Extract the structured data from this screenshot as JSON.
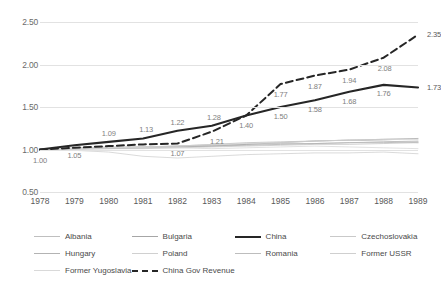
{
  "chart_data": {
    "type": "line",
    "title": "",
    "subtitle": "",
    "xlabel": "",
    "ylabel": "",
    "x": [
      1978,
      1979,
      1980,
      1981,
      1982,
      1983,
      1984,
      1985,
      1986,
      1987,
      1988,
      1989
    ],
    "categories": [
      "1978",
      "1979",
      "1980",
      "1981",
      "1982",
      "1983",
      "1984",
      "1985",
      "1986",
      "1987",
      "1988",
      "1989"
    ],
    "ylim": [
      0.5,
      2.5
    ],
    "yticks": [
      0.5,
      1.0,
      1.5,
      2.0,
      2.5
    ],
    "ytick_labels": [
      "0.50",
      "1.00",
      "1.50",
      "2.00",
      "2.50"
    ],
    "grid": true,
    "legend_position": "bottom",
    "series": [
      {
        "name": "Albania",
        "style": "thin-grey",
        "color": "#bfbfbf",
        "width": 0.8,
        "dash": "none",
        "labelled": false,
        "values": [
          1.0,
          1.01,
          1.02,
          1.03,
          1.04,
          1.05,
          1.06,
          1.07,
          1.07,
          1.08,
          1.09,
          1.1
        ]
      },
      {
        "name": "Bulgaria",
        "style": "thin-grey",
        "color": "#a6a6a6",
        "width": 0.8,
        "dash": "none",
        "labelled": false,
        "values": [
          1.0,
          1.01,
          1.02,
          1.02,
          1.03,
          1.04,
          1.06,
          1.08,
          1.1,
          1.11,
          1.12,
          1.13
        ]
      },
      {
        "name": "China",
        "style": "thick-black",
        "color": "#262626",
        "width": 2.1,
        "dash": "none",
        "labelled": true,
        "values": [
          1.0,
          1.05,
          1.09,
          1.13,
          1.22,
          1.28,
          1.4,
          1.5,
          1.58,
          1.68,
          1.76,
          1.73
        ]
      },
      {
        "name": "Czechoslovakia",
        "style": "thin-grey",
        "color": "#c9c9c9",
        "width": 0.8,
        "dash": "none",
        "labelled": false,
        "values": [
          1.0,
          1.0,
          1.01,
          1.01,
          1.02,
          1.03,
          1.04,
          1.05,
          1.06,
          1.06,
          1.07,
          1.08
        ]
      },
      {
        "name": "Hungary",
        "style": "thin-grey",
        "color": "#b3b3b3",
        "width": 0.8,
        "dash": "none",
        "labelled": false,
        "values": [
          1.0,
          1.01,
          1.01,
          1.02,
          1.03,
          1.04,
          1.05,
          1.06,
          1.07,
          1.08,
          1.08,
          1.09
        ]
      },
      {
        "name": "Poland",
        "style": "thin-grey",
        "color": "#d0d0d0",
        "width": 0.8,
        "dash": "none",
        "labelled": false,
        "values": [
          1.0,
          0.99,
          0.97,
          0.92,
          0.9,
          0.92,
          0.94,
          0.95,
          0.96,
          0.96,
          0.97,
          0.95
        ]
      },
      {
        "name": "Romania",
        "style": "thin-grey",
        "color": "#bdbdbd",
        "width": 0.8,
        "dash": "none",
        "labelled": false,
        "values": [
          1.0,
          1.02,
          1.03,
          1.03,
          1.04,
          1.06,
          1.08,
          1.09,
          1.1,
          1.11,
          1.1,
          1.08
        ]
      },
      {
        "name": "Former USSR",
        "style": "thin-grey",
        "color": "#cfcfcf",
        "width": 0.8,
        "dash": "none",
        "labelled": false,
        "values": [
          1.0,
          1.01,
          1.02,
          1.03,
          1.04,
          1.06,
          1.07,
          1.08,
          1.1,
          1.11,
          1.12,
          1.12
        ]
      },
      {
        "name": "Former Yugoslavia",
        "style": "thin-grey",
        "color": "#d9d9d9",
        "width": 0.8,
        "dash": "none",
        "labelled": false,
        "values": [
          1.0,
          1.01,
          1.02,
          1.02,
          1.02,
          1.01,
          1.02,
          1.03,
          1.04,
          1.03,
          1.02,
          1.01
        ]
      },
      {
        "name": "China Gov Revenue",
        "style": "thick-dashed-black",
        "color": "#262626",
        "width": 2.0,
        "dash": "7 4",
        "labelled": true,
        "values": [
          1.0,
          1.02,
          1.04,
          1.06,
          1.07,
          1.21,
          1.4,
          1.77,
          1.87,
          1.94,
          2.08,
          2.35
        ]
      }
    ],
    "data_labels": [
      {
        "series": "China",
        "x": 1978,
        "value": "1.00",
        "dx": 0,
        "dy": 10
      },
      {
        "series": "China",
        "x": 1979,
        "value": "1.05",
        "dx": 0,
        "dy": 10
      },
      {
        "series": "China",
        "x": 1980,
        "value": "1.09",
        "dx": 0,
        "dy": -9
      },
      {
        "series": "China",
        "x": 1981,
        "value": "1.13",
        "dx": 3,
        "dy": -9
      },
      {
        "series": "China",
        "x": 1982,
        "value": "1.22",
        "dx": 0,
        "dy": -9
      },
      {
        "series": "China",
        "x": 1983,
        "value": "1.28",
        "dx": 2,
        "dy": -9
      },
      {
        "series": "China",
        "x": 1984,
        "value": "1.40",
        "dx": 0,
        "dy": 9
      },
      {
        "series": "China",
        "x": 1985,
        "value": "1.50",
        "dx": 0,
        "dy": 9
      },
      {
        "series": "China",
        "x": 1986,
        "value": "1.58",
        "dx": 0,
        "dy": 9
      },
      {
        "series": "China",
        "x": 1987,
        "value": "1.68",
        "dx": 0,
        "dy": 9
      },
      {
        "series": "China",
        "x": 1988,
        "value": "1.76",
        "dx": 0,
        "dy": 8
      },
      {
        "series": "China",
        "x": 1989,
        "value": "1.73",
        "dx": 16,
        "dy": 0
      },
      {
        "series": "China Gov Revenue",
        "x": 1982,
        "value": "1.07",
        "dx": 0,
        "dy": 9
      },
      {
        "series": "China Gov Revenue",
        "x": 1983,
        "value": "1.21",
        "dx": 5,
        "dy": 9
      },
      {
        "series": "China Gov Revenue",
        "x": 1985,
        "value": "1.77",
        "dx": 0,
        "dy": 10
      },
      {
        "series": "China Gov Revenue",
        "x": 1986,
        "value": "1.87",
        "dx": 0,
        "dy": 10
      },
      {
        "series": "China Gov Revenue",
        "x": 1987,
        "value": "1.94",
        "dx": 0,
        "dy": 10
      },
      {
        "series": "China Gov Revenue",
        "x": 1988,
        "value": "2.08",
        "dx": 1,
        "dy": 10
      },
      {
        "series": "China Gov Revenue",
        "x": 1989,
        "value": "2.35",
        "dx": 16,
        "dy": -1
      }
    ]
  },
  "legend": {
    "items": [
      {
        "label": "Albania",
        "color": "#bfbfbf",
        "width": 1,
        "dash": "none"
      },
      {
        "label": "Bulgaria",
        "color": "#a6a6a6",
        "width": 1,
        "dash": "none"
      },
      {
        "label": "China",
        "color": "#262626",
        "width": 2.4,
        "dash": "none"
      },
      {
        "label": "Czechoslovakia",
        "color": "#c9c9c9",
        "width": 1,
        "dash": "none"
      },
      {
        "label": "Hungary",
        "color": "#b3b3b3",
        "width": 1,
        "dash": "none"
      },
      {
        "label": "Poland",
        "color": "#d0d0d0",
        "width": 1,
        "dash": "none"
      },
      {
        "label": "Romania",
        "color": "#bdbdbd",
        "width": 1,
        "dash": "none"
      },
      {
        "label": "Former USSR",
        "color": "#cfcfcf",
        "width": 1,
        "dash": "none"
      },
      {
        "label": "Former Yugoslavia",
        "color": "#d9d9d9",
        "width": 1,
        "dash": "none"
      },
      {
        "label": "China Gov Revenue",
        "color": "#262626",
        "width": 2.4,
        "dash": "dashed"
      }
    ]
  },
  "colors": {
    "background": "#ffffff",
    "gridline": "#e2e2e2",
    "axis_text": "#595959",
    "data_label": "#7f7f7f",
    "emphasis": "#262626"
  }
}
